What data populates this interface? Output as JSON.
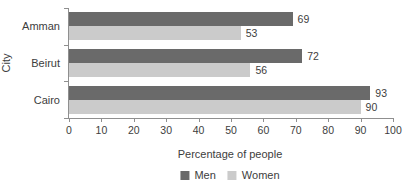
{
  "chart_data": {
    "type": "bar",
    "orientation": "horizontal",
    "title": "",
    "categories": [
      "Amman",
      "Beirut",
      "Cairo"
    ],
    "series": [
      {
        "name": "Men",
        "color": "#6a6a6a",
        "values": [
          69,
          72,
          93
        ]
      },
      {
        "name": "Women",
        "color": "#cbcbcb",
        "values": [
          53,
          56,
          90
        ]
      }
    ],
    "xlabel": "Percentage of people",
    "ylabel": "City",
    "xlim": [
      0,
      100
    ],
    "xticks": [
      0,
      10,
      20,
      30,
      40,
      50,
      60,
      70,
      80,
      90,
      100
    ],
    "grid": false,
    "legend_position": "bottom",
    "data_labels": true
  },
  "colors": {
    "axis": "#8f8f8f",
    "text": "#3d3d3d",
    "background": "#ffffff"
  }
}
